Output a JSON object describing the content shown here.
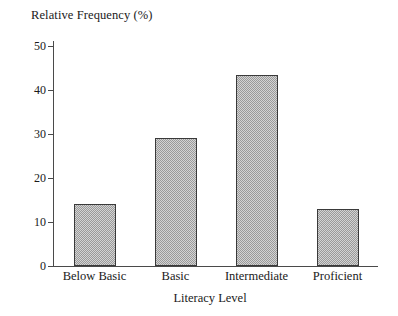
{
  "chart_data": {
    "type": "bar",
    "title": "",
    "ylabel": "Relative Frequency (%)",
    "xlabel": "Literacy Level",
    "categories": [
      "Below Basic",
      "Basic",
      "Intermediate",
      "Proficient"
    ],
    "values": [
      14.1,
      29.2,
      43.5,
      13.0
    ],
    "ylim": [
      0,
      50
    ],
    "yticks": [
      0,
      10,
      20,
      30,
      40,
      50
    ],
    "ytick_labels": [
      "0",
      "10",
      "20",
      "30",
      "40",
      "50"
    ],
    "grid": false,
    "legend": null,
    "bar_fill_color": "#c8c8c8",
    "bar_edge_color": "#3a3a3a",
    "axis_color": "#4a4a4a",
    "background_color": "#ffffff",
    "bars": [
      {
        "category": "Below Basic",
        "value": 14.1
      },
      {
        "category": "Basic",
        "value": 29.2
      },
      {
        "category": "Intermediate",
        "value": 43.5
      },
      {
        "category": "Proficient",
        "value": 13.0
      }
    ]
  }
}
